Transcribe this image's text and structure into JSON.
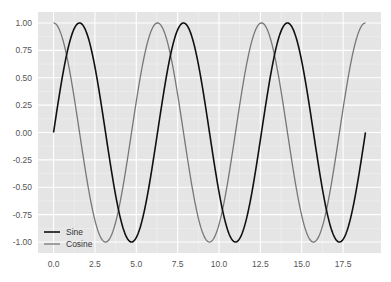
{
  "chart_data": {
    "type": "line",
    "title": "",
    "xlabel": "",
    "ylabel": "",
    "xlim": [
      -0.94,
      19.79
    ],
    "ylim": [
      -1.1,
      1.1
    ],
    "grid": true,
    "style": "ggplot-like gray background with white grid",
    "x_ticks": [
      "0.0",
      "2.5",
      "5.0",
      "7.5",
      "10.0",
      "12.5",
      "15.0",
      "17.5"
    ],
    "x_tick_values": [
      0,
      2.5,
      5,
      7.5,
      10,
      12.5,
      15,
      17.5
    ],
    "y_ticks": [
      "1.00",
      "0.75",
      "0.50",
      "0.25",
      "0.00",
      "-0.25",
      "-0.50",
      "-0.75",
      "-1.00"
    ],
    "y_tick_values": [
      1,
      0.75,
      0.5,
      0.25,
      0,
      -0.25,
      -0.5,
      -0.75,
      -1
    ],
    "x_range": [
      0,
      18.85
    ],
    "series": [
      {
        "name": "Sine",
        "function": "sin(x)",
        "color": "#111111",
        "linewidth": 1.6
      },
      {
        "name": "Cosine",
        "function": "cos(x)",
        "color": "#777777",
        "linewidth": 1.3
      }
    ],
    "legend": {
      "position": "lower left",
      "entries": [
        "Sine",
        "Cosine"
      ]
    }
  },
  "colors": {
    "plot_background": "#e5e5e5",
    "grid": "#ffffff",
    "sine": "#111111",
    "cosine": "#777777"
  }
}
